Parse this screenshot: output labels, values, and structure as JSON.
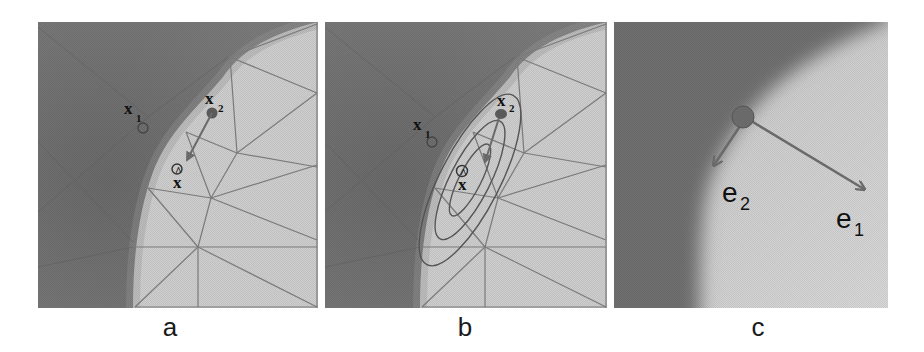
{
  "figure": {
    "panels": [
      {
        "id": "a",
        "caption": "a",
        "points": {
          "x1": {
            "label": "x",
            "sub": "1",
            "marker": "hollow-circle"
          },
          "x2": {
            "label": "x",
            "sub": "2",
            "marker": "filled-circle"
          },
          "xhat": {
            "label": "x̂",
            "marker": "hollow-circle"
          }
        },
        "arrow": "x2 → x̂"
      },
      {
        "id": "b",
        "caption": "b",
        "points": {
          "x1": {
            "label": "x",
            "sub": "1",
            "marker": "hollow-circle"
          },
          "x2": {
            "label": "x",
            "sub": "2",
            "marker": "filled-circle"
          },
          "xhat": {
            "label": "x̂",
            "marker": "hollow-circle"
          }
        },
        "ellipses": 3,
        "arrow": "x2 → x̂"
      },
      {
        "id": "c",
        "caption": "c",
        "vectors": [
          {
            "label": "e",
            "sub": "1"
          },
          {
            "label": "e",
            "sub": "2"
          }
        ]
      }
    ],
    "colors": {
      "dark_region": "#6e6e6e",
      "light_region": "#cfcfcf",
      "mesh_line": "#7a7a7a",
      "marker": "#5a5a5a",
      "arrow": "#6a6a6a",
      "ellipse": "#555555"
    }
  }
}
